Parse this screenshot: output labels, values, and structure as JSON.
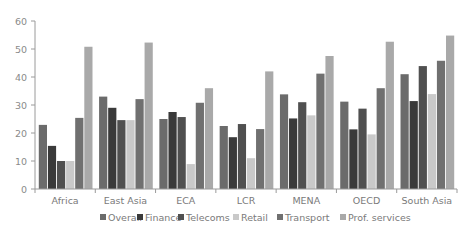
{
  "chart_data": {
    "type": "bar",
    "title": "",
    "xlabel": "",
    "ylabel": "",
    "ylim": [
      0,
      60
    ],
    "yticks": [
      0,
      10,
      20,
      30,
      40,
      50,
      60
    ],
    "grid": false,
    "legend_position": "bottom",
    "categories": [
      "Africa",
      "East Asia",
      "ECA",
      "LCR",
      "MENA",
      "OECD",
      "South Asia"
    ],
    "series": [
      {
        "name": "Overall",
        "color": "#6b6b6b",
        "values": [
          22.9,
          33.0,
          25.0,
          22.5,
          33.8,
          31.2,
          41.0
        ]
      },
      {
        "name": "Finance",
        "color": "#3a3a3a",
        "values": [
          15.4,
          29.0,
          27.5,
          18.5,
          25.2,
          21.3,
          31.4
        ]
      },
      {
        "name": "Telecoms",
        "color": "#505050",
        "values": [
          10.0,
          24.6,
          25.7,
          23.2,
          31.0,
          28.7,
          43.9
        ]
      },
      {
        "name": "Retail",
        "color": "#c9c9c9",
        "values": [
          10.0,
          24.6,
          8.9,
          11.0,
          26.3,
          19.5,
          33.9
        ]
      },
      {
        "name": "Transport",
        "color": "#707070",
        "values": [
          25.4,
          32.1,
          30.8,
          21.4,
          41.2,
          36.0,
          45.8
        ]
      },
      {
        "name": "Prof. services",
        "color": "#a9a9a9",
        "values": [
          50.8,
          52.3,
          36.0,
          42.0,
          47.5,
          52.6,
          54.8
        ]
      }
    ]
  }
}
